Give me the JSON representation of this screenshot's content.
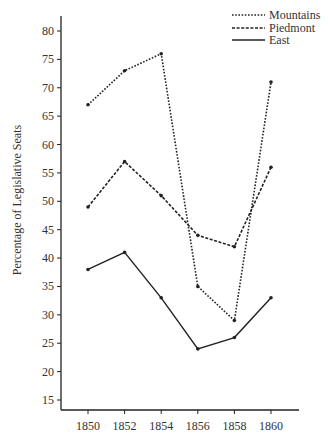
{
  "chart_data": {
    "type": "line",
    "title": "",
    "xlabel": "",
    "ylabel": "Percentage of Legislative Seats",
    "x": [
      1850,
      1852,
      1854,
      1856,
      1858,
      1860
    ],
    "x_tick_labels": [
      "1850",
      "1852",
      "1854",
      "1856",
      "1858",
      "1860"
    ],
    "y_ticks": [
      15,
      20,
      25,
      30,
      35,
      40,
      45,
      50,
      55,
      60,
      65,
      70,
      75,
      80
    ],
    "ylim": [
      13.5,
      82
    ],
    "grid": false,
    "legend_position": "top-right",
    "series": [
      {
        "name": "Mountains",
        "style": "dotted",
        "values": [
          67,
          73,
          76,
          35,
          29,
          71
        ]
      },
      {
        "name": "Piedmont",
        "style": "dashed",
        "values": [
          49,
          57,
          51,
          44,
          42,
          56
        ]
      },
      {
        "name": "East",
        "style": "solid",
        "values": [
          38,
          41,
          33,
          24,
          26,
          33
        ]
      }
    ],
    "colors": {
      "line": "#222222",
      "axis": "#222222",
      "text": "#333333"
    }
  }
}
